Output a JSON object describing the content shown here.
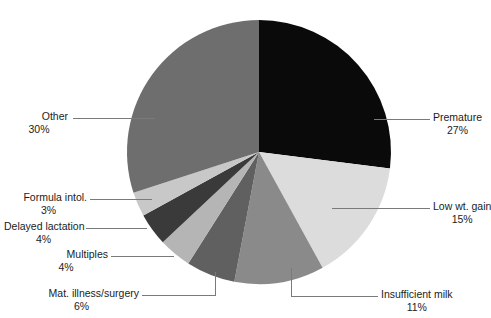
{
  "chart_data": {
    "type": "pie",
    "title": "",
    "subtitle": "",
    "xlabel": "",
    "ylabel": "",
    "legend_position": "callout-labels",
    "grid": false,
    "start_angle_deg": 0,
    "direction": "clockwise",
    "categories": [
      "Premature",
      "Low wt. gain",
      "Insufficient milk",
      "Mat. illness/surgery",
      "Multiples",
      "Delayed lactation",
      "Formula intol.",
      "Other"
    ],
    "values": [
      27,
      15,
      11,
      6,
      4,
      4,
      3,
      30
    ],
    "value_labels": [
      "27%",
      "15%",
      "11%",
      "6%",
      "4%",
      "4%",
      "3%",
      "30%"
    ],
    "unit": "%",
    "colors": [
      "#0a0a0a",
      "#dcdcdc",
      "#8a8a8a",
      "#606060",
      "#b5b5b5",
      "#3a3a3a",
      "#c8c8c8",
      "#6e6e6e"
    ],
    "slices": [
      {
        "label": "Premature",
        "value": 27,
        "value_label": "27%",
        "color": "#0a0a0a"
      },
      {
        "label": "Low wt. gain",
        "value": 15,
        "value_label": "15%",
        "color": "#dcdcdc"
      },
      {
        "label": "Insufficient milk",
        "value": 11,
        "value_label": "11%",
        "color": "#8a8a8a"
      },
      {
        "label": "Mat. illness/surgery",
        "value": 6,
        "value_label": "6%",
        "color": "#606060"
      },
      {
        "label": "Multiples",
        "value": 4,
        "value_label": "4%",
        "color": "#b5b5b5"
      },
      {
        "label": "Delayed lactation",
        "value": 4,
        "value_label": "4%",
        "color": "#3a3a3a"
      },
      {
        "label": "Formula intol.",
        "value": 3,
        "value_label": "3%",
        "color": "#c8c8c8"
      },
      {
        "label": "Other",
        "value": 30,
        "value_label": "30%",
        "color": "#6e6e6e"
      }
    ]
  },
  "callouts": {
    "premature": {
      "name": "Premature",
      "pct": "27%"
    },
    "low_wt_gain": {
      "name": "Low wt. gain",
      "pct": "15%"
    },
    "insufficient": {
      "name": "Insufficient milk",
      "pct": "11%"
    },
    "mat_illness": {
      "name": "Mat. illness/surgery",
      "pct": "6%"
    },
    "multiples": {
      "name": "Multiples",
      "pct": "4%"
    },
    "delayed_lactation": {
      "name": "Delayed lactation",
      "pct": "4%"
    },
    "formula_intol": {
      "name": "Formula intol.",
      "pct": "3%"
    },
    "other": {
      "name": "Other",
      "pct": "30%"
    }
  }
}
